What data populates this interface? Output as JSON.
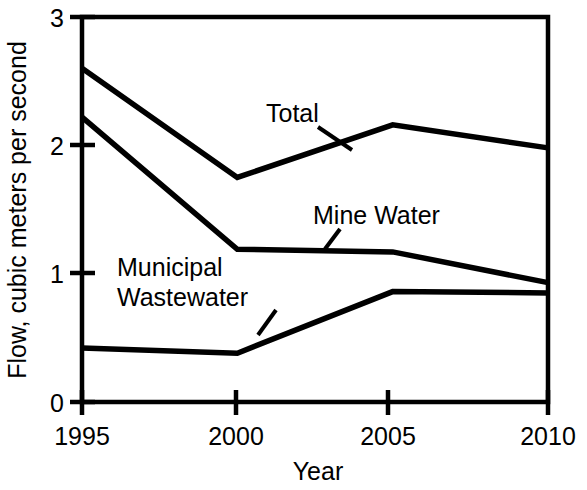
{
  "chart_data": {
    "type": "line",
    "title": "",
    "xlabel": "Year",
    "ylabel": "Flow, cubic meters per second",
    "x": [
      1995,
      2000,
      2005,
      2010
    ],
    "xticklabels": [
      "1995",
      "2000",
      "2005",
      "2010"
    ],
    "yticklabels": [
      "0",
      "1",
      "2",
      "3"
    ],
    "yticks": [
      0,
      1,
      2,
      3
    ],
    "xlim": [
      1995,
      2010
    ],
    "ylim": [
      0,
      3
    ],
    "grid": false,
    "legend": "inline-labels",
    "line_color": "#000000",
    "background_color": "#ffffff",
    "series": [
      {
        "name": "Total",
        "label": "Total",
        "values": [
          2.6,
          1.75,
          2.16,
          1.98
        ]
      },
      {
        "name": "Mine Water",
        "label": "Mine Water",
        "values": [
          2.22,
          1.19,
          1.17,
          0.93
        ]
      },
      {
        "name": "Municipal Wastewater",
        "label": "Municipal\nWastewater",
        "label_line1": "Municipal",
        "label_line2": "Wastewater",
        "values": [
          0.42,
          0.38,
          0.86,
          0.85
        ]
      }
    ],
    "annotations": [
      {
        "text": "Total",
        "points_to_series": "Total"
      },
      {
        "text": "Mine Water",
        "points_to_series": "Mine Water"
      },
      {
        "text": "Municipal Wastewater",
        "points_to_series": "Municipal Wastewater"
      }
    ]
  },
  "axis": {
    "y_label": "Flow, cubic meters per second",
    "x_label": "Year",
    "y_tick_0": "0",
    "y_tick_1": "1",
    "y_tick_2": "2",
    "y_tick_3": "3",
    "x_tick_0": "1995",
    "x_tick_1": "2000",
    "x_tick_2": "2005",
    "x_tick_3": "2010"
  },
  "labels": {
    "total": "Total",
    "mine_water": "Mine Water",
    "municipal_line1": "Municipal",
    "municipal_line2": "Wastewater"
  }
}
